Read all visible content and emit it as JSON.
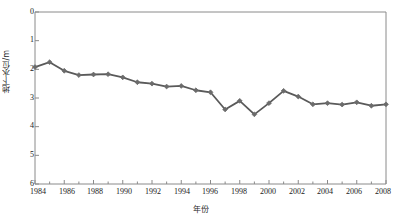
{
  "chart_data": {
    "type": "line",
    "title": "",
    "xlabel": "年份",
    "ylabel": "地下水位/m",
    "x": [
      1984,
      1985,
      1986,
      1987,
      1988,
      1989,
      1990,
      1991,
      1992,
      1993,
      1994,
      1995,
      1996,
      1997,
      1998,
      1999,
      2000,
      2001,
      2002,
      2003,
      2004,
      2005,
      2006,
      2007,
      2008
    ],
    "values": [
      1.92,
      1.75,
      2.05,
      2.2,
      2.18,
      2.17,
      2.28,
      2.45,
      2.5,
      2.6,
      2.58,
      2.73,
      2.8,
      3.4,
      3.1,
      3.57,
      3.18,
      2.75,
      2.95,
      3.22,
      3.18,
      3.23,
      3.15,
      3.27,
      3.22
    ],
    "series": [
      {
        "name": "地下水位",
        "values": [
          1.92,
          1.75,
          2.05,
          2.2,
          2.18,
          2.17,
          2.28,
          2.45,
          2.5,
          2.6,
          2.58,
          2.73,
          2.8,
          3.4,
          3.1,
          3.57,
          3.18,
          2.75,
          2.95,
          3.22,
          3.18,
          3.23,
          3.15,
          3.27,
          3.22
        ]
      }
    ],
    "xlim": [
      1984,
      2008
    ],
    "ylim": [
      0,
      6
    ],
    "y_axis_inverted": true,
    "y_ticks": [
      "0",
      "1",
      "2",
      "3",
      "4",
      "5",
      "6"
    ],
    "y_tick_values": [
      0,
      1,
      2,
      3,
      4,
      5,
      6
    ],
    "x_ticks": [
      "1984",
      "1986",
      "1988",
      "1990",
      "1992",
      "1994",
      "1996",
      "1998",
      "2000",
      "2002",
      "2004",
      "2006",
      "2008"
    ],
    "x_tick_values": [
      1984,
      1986,
      1988,
      1990,
      1992,
      1994,
      1996,
      1998,
      2000,
      2002,
      2004,
      2006,
      2008
    ],
    "x_minor_tick_values": [
      1985,
      1987,
      1989,
      1991,
      1993,
      1995,
      1997,
      1999,
      2001,
      2003,
      2005,
      2007
    ],
    "grid": false,
    "legend": "none",
    "marker": "diamond",
    "line_color": "#5a5a5a",
    "marker_color": "#6b6b6b",
    "axis_color": "#8a8a8a",
    "text_color": "#1a1a1a"
  }
}
